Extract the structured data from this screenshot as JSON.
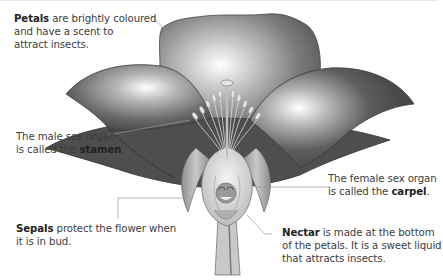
{
  "diagram": {
    "colors": {
      "petal_dark": "#4a4a4a",
      "petal_mid": "#8a8a8a",
      "petal_highlight": "#ffffff",
      "sepal": "#a8a8a8",
      "carpel": "#d9d9d9",
      "leader_line": "#9a9a9a",
      "text": "#3c3c3c"
    },
    "labels": {
      "petals": {
        "term": "Petals",
        "rest_line1": " are brightly coloured",
        "line2": "and have a scent to",
        "line3": "attract insects."
      },
      "stamen": {
        "line1": "The male sex organ",
        "prefix2": "is called the ",
        "term": "stamen",
        "suffix": "."
      },
      "carpel": {
        "line1": "The female sex organ",
        "prefix2": "is called the ",
        "term": "carpel",
        "suffix": "."
      },
      "sepals": {
        "term": "Sepals",
        "rest_line1": " protect the flower when",
        "line2": "it is in bud."
      },
      "nectar": {
        "term": "Nectar",
        "rest_line1": " is made at the bottom",
        "line2": "of the petals. It is a sweet liquid",
        "line3": "that attracts insects."
      }
    }
  }
}
